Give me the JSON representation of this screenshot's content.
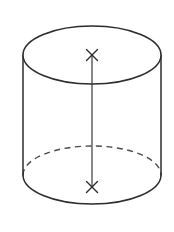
{
  "figure": {
    "type": "3d-solid-diagram",
    "shape_name": "cylinder",
    "background_color": "#ffffff",
    "canvas": {
      "width": 174,
      "height": 232
    }
  },
  "style": {
    "outline_color": "#2b2b2b",
    "outline_width": 1.5,
    "hidden_edge_color": "#4a4a4a",
    "hidden_edge_width": 1.4,
    "hidden_edge_dash": "6 4.5",
    "axis_color": "#3a3a3a",
    "axis_width": 1.2,
    "marker_color": "#2b2b2b",
    "face_fill": "#ffffff"
  },
  "geometry": {
    "top_ellipse": {
      "label": "top circular face",
      "cx": 92,
      "cy": 55,
      "rx": 69,
      "ry": 29,
      "visible": "full-outline"
    },
    "bottom_ellipse": {
      "label": "bottom circular face",
      "cx": 92,
      "cy": 175,
      "rx": 69,
      "ry": 29,
      "front_arc": "solid",
      "back_arc": "dashed"
    },
    "left_side": {
      "label": "left lateral edge",
      "x": 23,
      "y1": 55,
      "y2": 175
    },
    "right_side": {
      "label": "right lateral edge",
      "x": 161,
      "y1": 55,
      "y2": 175
    },
    "axis_line": {
      "label": "central axis",
      "x": 92,
      "y1": 55,
      "y2": 187,
      "style": "solid"
    },
    "markers": [
      {
        "name": "top-center-marker",
        "glyph": "x",
        "cx": 92,
        "cy": 55,
        "size": 5.5
      },
      {
        "name": "bottom-center-marker",
        "glyph": "x",
        "cx": 92,
        "cy": 187,
        "size": 5.5
      }
    ]
  },
  "annotations": {
    "top_marker_meaning": "center of top circular face",
    "bottom_marker_meaning": "center of bottom circular face",
    "axis_meaning": "height axis joining the two face centers"
  }
}
